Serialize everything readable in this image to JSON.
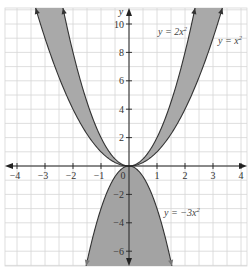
{
  "chart_data": {
    "type": "line",
    "title": "",
    "xlabel": "",
    "ylabel": "y",
    "xlim": [
      -4.4,
      4.2
    ],
    "ylim": [
      -7.0,
      11.0
    ],
    "grid": true,
    "x_ticks": [
      -4,
      -3,
      -2,
      -1,
      0,
      1,
      2,
      3,
      4
    ],
    "y_ticks": [
      -6,
      -4,
      -2,
      2,
      4,
      6,
      8,
      10
    ],
    "x_tick_labels": [
      "−4",
      "−3",
      "−2",
      "−1",
      "1",
      "2",
      "3",
      "4"
    ],
    "y_tick_labels": [
      "10",
      "8",
      "6",
      "4",
      "2",
      "−2",
      "−4",
      "−6"
    ],
    "origin_label": "0",
    "series": [
      {
        "name": "y = x²",
        "function": "x^2",
        "coefficient": 1,
        "label": "y = x"
      },
      {
        "name": "y = 2x²",
        "function": "2*x^2",
        "coefficient": 2,
        "label": "y = 2x"
      },
      {
        "name": "y = −3x²",
        "function": "-3*x^2",
        "coefficient": -3,
        "label": "y = −3x"
      }
    ],
    "shaded_regions": [
      "between y = x² and y = 2x² (both sides)",
      "under y = −3x² down to bottom of plot"
    ],
    "sample_points": {
      "y = x^2": {
        "x": [
          -3,
          -2,
          -1,
          0,
          1,
          2,
          3
        ],
        "y": [
          9,
          4,
          1,
          0,
          1,
          4,
          9
        ]
      },
      "y = 2x^2": {
        "x": [
          -2,
          -1,
          0,
          1,
          2
        ],
        "y": [
          8,
          2,
          0,
          2,
          8
        ]
      },
      "y = -3x^2": {
        "x": [
          -1.5,
          -1,
          0,
          1,
          1.5
        ],
        "y": [
          -6.75,
          -3,
          0,
          -3,
          -6.75
        ]
      }
    }
  },
  "labels": {
    "y_axis": "y",
    "x_axis_arrow": "x",
    "origin": "0",
    "curve_x2": "y = x",
    "curve_2x2": "y = 2x",
    "curve_neg3x2": "y = −3x",
    "superscript": "2"
  },
  "colors": {
    "grid": "#d6d6d6",
    "axis": "#222222",
    "curve": "#333333",
    "shade_upper": "#a9a9a9",
    "shade_lower": "#a3a3a3",
    "background": "#ffffff"
  }
}
